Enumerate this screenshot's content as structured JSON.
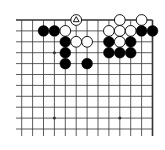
{
  "board": {
    "type": "go-board-fragment",
    "visible_columns": 13,
    "visible_rows": 11,
    "edges": {
      "top": true,
      "right": true,
      "left": false,
      "bottom": false
    },
    "geometry": {
      "origin_x": 21.7,
      "origin_y": 20,
      "spacing": 10.9,
      "stone_radius": 5.4,
      "left_overhang": 5.7,
      "bottom_overhang": 7
    },
    "colors": {
      "background": "#ffffff",
      "line": "#333333",
      "black_stone": "#000000",
      "white_stone": "#ffffff",
      "white_stone_stroke": "#000000"
    },
    "hoshi": [
      {
        "col": 3,
        "row": 3
      },
      {
        "col": 9,
        "row": 3
      },
      {
        "col": 3,
        "row": 9
      },
      {
        "col": 9,
        "row": 9
      }
    ],
    "stones": [
      {
        "col": 5,
        "row": 0,
        "color": "white",
        "mark": "triangle"
      },
      {
        "col": 9,
        "row": 0,
        "color": "white"
      },
      {
        "col": 11,
        "row": 0,
        "color": "white"
      },
      {
        "col": 2,
        "row": 1,
        "color": "black"
      },
      {
        "col": 3,
        "row": 1,
        "color": "black"
      },
      {
        "col": 4,
        "row": 1,
        "color": "white"
      },
      {
        "col": 8,
        "row": 1,
        "color": "white"
      },
      {
        "col": 9,
        "row": 1,
        "color": "white"
      },
      {
        "col": 10,
        "row": 1,
        "color": "white"
      },
      {
        "col": 11,
        "row": 1,
        "color": "black"
      },
      {
        "col": 12,
        "row": 1,
        "color": "black"
      },
      {
        "col": 4,
        "row": 2,
        "color": "black"
      },
      {
        "col": 5,
        "row": 2,
        "color": "white"
      },
      {
        "col": 6,
        "row": 2,
        "color": "white"
      },
      {
        "col": 8,
        "row": 2,
        "color": "black"
      },
      {
        "col": 9,
        "row": 2,
        "color": "white"
      },
      {
        "col": 10,
        "row": 2,
        "color": "black"
      },
      {
        "col": 4,
        "row": 3,
        "color": "black"
      },
      {
        "col": 8,
        "row": 3,
        "color": "black"
      },
      {
        "col": 9,
        "row": 3,
        "color": "black"
      },
      {
        "col": 10,
        "row": 3,
        "color": "black"
      },
      {
        "col": 4,
        "row": 4,
        "color": "black"
      },
      {
        "col": 6,
        "row": 4,
        "color": "black"
      }
    ]
  }
}
